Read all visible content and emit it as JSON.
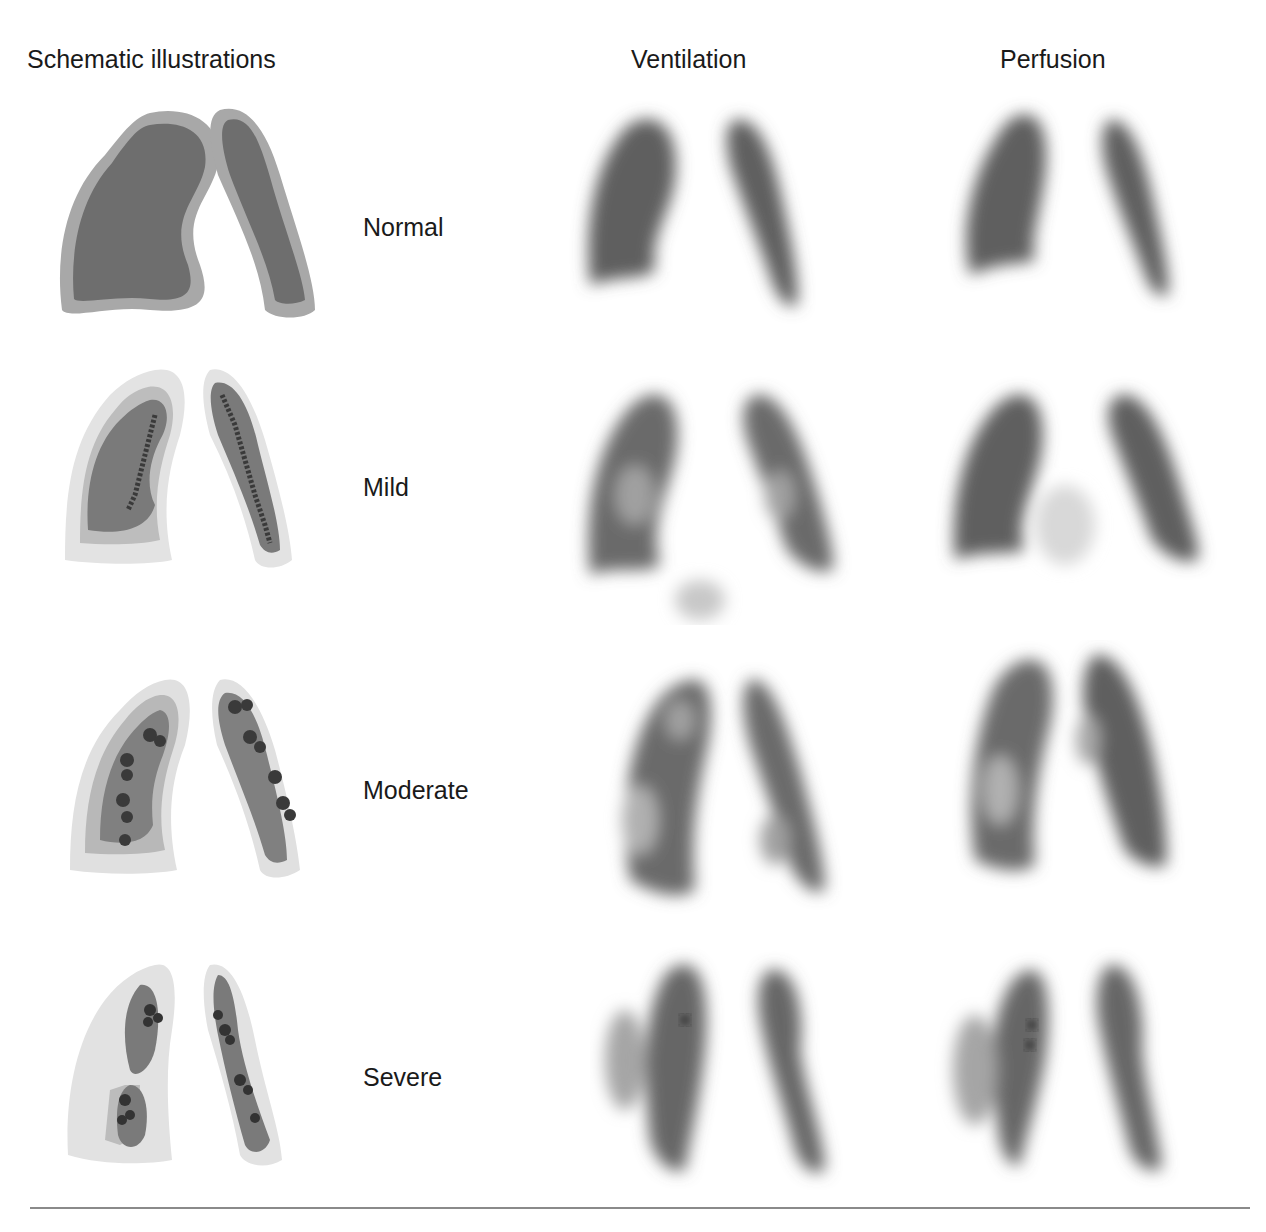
{
  "headers": {
    "schematic": "Schematic illustrations",
    "ventilation": "Ventilation",
    "perfusion": "Perfusion"
  },
  "rows": [
    {
      "label": "Normal"
    },
    {
      "label": "Mild"
    },
    {
      "label": "Moderate"
    },
    {
      "label": "Severe"
    }
  ],
  "colors": {
    "lung_dark": "#6e6e6e",
    "lung_mid": "#9a9a9a",
    "lung_light": "#cfcfcf",
    "scan_dark": "#5e5e5e",
    "rule": "#8a8a8a"
  }
}
